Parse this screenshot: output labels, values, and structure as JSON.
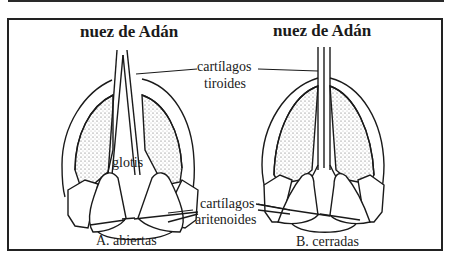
{
  "diagram": {
    "panel_a": {
      "title": "nuez de Adán",
      "glottis_label": "glotis",
      "caption": "A.  abiertas"
    },
    "panel_b": {
      "title": "nuez de Adán",
      "caption": "B.  cerradas"
    },
    "shared_labels": {
      "thyroid_line1": "cartílagos",
      "thyroid_line2": "tiroides",
      "arytenoid_line1": "cartílagos",
      "arytenoid_line2": "aritenoides"
    },
    "colors": {
      "line": "#1a1a1a",
      "background": "#ffffff",
      "stipple": "#555555"
    }
  }
}
